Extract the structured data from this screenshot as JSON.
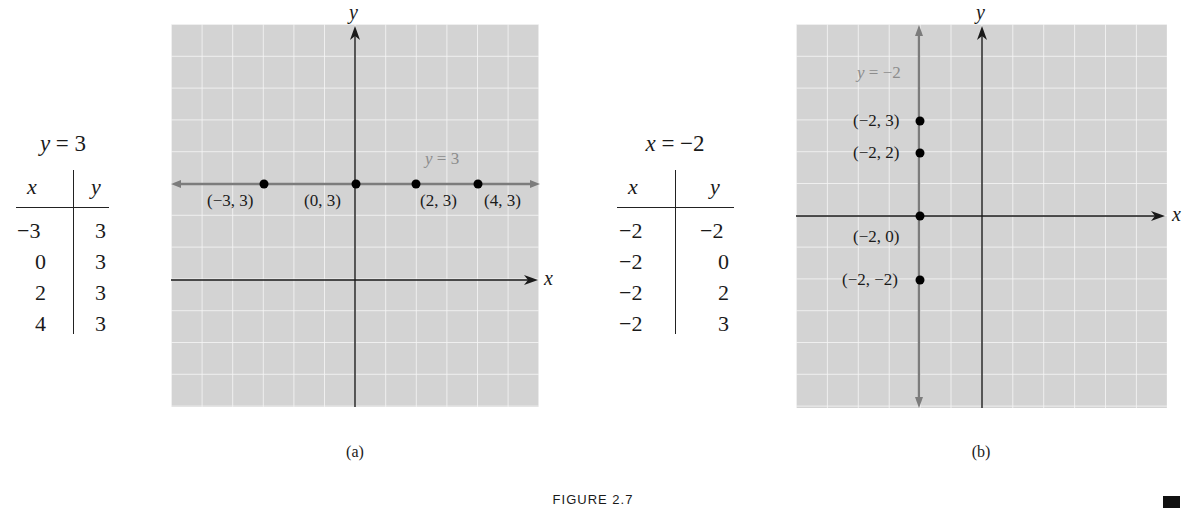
{
  "figure": {
    "caption": "FIGURE 2.7",
    "end_marker": "■"
  },
  "panel_a": {
    "label": "(a)",
    "table": {
      "title": "y = 3",
      "headers": [
        "x",
        "y"
      ],
      "rows": [
        [
          "−3",
          "3"
        ],
        [
          "0",
          "3"
        ],
        [
          "2",
          "3"
        ],
        [
          "4",
          "3"
        ]
      ]
    },
    "graph": {
      "x_axis_label": "x",
      "y_axis_label": "y",
      "line_label": "y = 3",
      "points": [
        {
          "x": -3,
          "y": 3,
          "label": "(−3, 3)"
        },
        {
          "x": 0,
          "y": 3,
          "label": "(0, 3)"
        },
        {
          "x": 2,
          "y": 3,
          "label": "(2, 3)"
        },
        {
          "x": 4,
          "y": 3,
          "label": "(4, 3)"
        }
      ]
    }
  },
  "panel_b": {
    "label": "(b)",
    "table": {
      "title": "x = −2",
      "headers": [
        "x",
        "y"
      ],
      "rows": [
        [
          "−2",
          "−2"
        ],
        [
          "−2",
          "0"
        ],
        [
          "−2",
          "2"
        ],
        [
          "−2",
          "3"
        ]
      ]
    },
    "graph": {
      "x_axis_label": "x",
      "y_axis_label": "y",
      "line_label": "y = −2",
      "points": [
        {
          "x": -2,
          "y": 3,
          "label": "(−2, 3)"
        },
        {
          "x": -2,
          "y": 2,
          "label": "(−2, 2)"
        },
        {
          "x": -2,
          "y": 0,
          "label": "(−2, 0)"
        },
        {
          "x": -2,
          "y": -2,
          "label": "(−2, −2)"
        }
      ]
    }
  },
  "colors": {
    "grid_background": "#d3d3d3",
    "grid_lines": "#f4f4f4",
    "axes": "#1a1a1a",
    "graph_line": "#7c7c7c",
    "graph_line_label": "#8c8c8c",
    "points": "#000000"
  },
  "chart_data": [
    {
      "type": "scatter",
      "title": "y = 3",
      "panel": "(a)",
      "xlabel": "x",
      "ylabel": "y",
      "xlim": [
        -6,
        6
      ],
      "ylim": [
        -4,
        8
      ],
      "grid": true,
      "line": {
        "equation": "y = 3",
        "orientation": "horizontal",
        "value": 3,
        "label": "y = 3"
      },
      "series": [
        {
          "name": "y = 3",
          "x": [
            -3,
            0,
            2,
            4
          ],
          "y": [
            3,
            3,
            3,
            3
          ]
        }
      ],
      "annotations": [
        "(−3, 3)",
        "(0, 3)",
        "(2, 3)",
        "(4, 3)",
        "y = 3"
      ],
      "table": {
        "headers": [
          "x",
          "y"
        ],
        "rows": [
          [
            -3,
            3
          ],
          [
            0,
            3
          ],
          [
            2,
            3
          ],
          [
            4,
            3
          ]
        ]
      }
    },
    {
      "type": "scatter",
      "title": "x = −2",
      "panel": "(b)",
      "xlabel": "x",
      "ylabel": "y",
      "xlim": [
        -6,
        6
      ],
      "ylim": [
        -6,
        6
      ],
      "grid": true,
      "line": {
        "equation": "x = −2",
        "orientation": "vertical",
        "value": -2,
        "label": "y = −2"
      },
      "series": [
        {
          "name": "x = −2",
          "x": [
            -2,
            -2,
            -2,
            -2
          ],
          "y": [
            3,
            2,
            0,
            -2
          ]
        }
      ],
      "annotations": [
        "(−2, 3)",
        "(−2, 2)",
        "(−2, 0)",
        "(−2, −2)",
        "y = −2"
      ],
      "table": {
        "headers": [
          "x",
          "y"
        ],
        "rows": [
          [
            -2,
            -2
          ],
          [
            -2,
            0
          ],
          [
            -2,
            2
          ],
          [
            -2,
            3
          ]
        ]
      }
    }
  ]
}
